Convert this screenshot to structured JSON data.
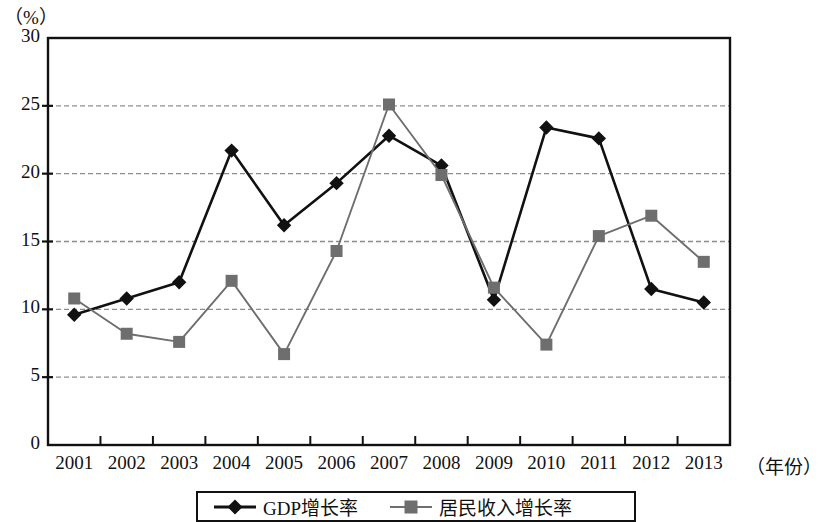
{
  "chart_data": {
    "type": "line",
    "title": "",
    "subtitle": "",
    "unit_label": "（%）",
    "xlabel": "（年份）",
    "ylabel": "",
    "ylim": [
      0,
      30
    ],
    "ytick_labels": [
      "0",
      "5",
      "10",
      "15",
      "20",
      "25",
      "30"
    ],
    "ytick_values": [
      0,
      5,
      10,
      15,
      20,
      25,
      30
    ],
    "grid": "horizontal-dashed",
    "legend_position": "bottom-center",
    "categories": [
      "2001",
      "2002",
      "2003",
      "2004",
      "2005",
      "2006",
      "2007",
      "2008",
      "2009",
      "2010",
      "2011",
      "2012",
      "2013"
    ],
    "series": [
      {
        "name": "GDP增长率",
        "marker": "diamond",
        "color": "#111111",
        "values": [
          9.6,
          10.8,
          12.0,
          21.7,
          16.2,
          19.3,
          22.8,
          20.6,
          10.7,
          23.4,
          22.6,
          11.5,
          10.5
        ]
      },
      {
        "name": "居民收入增长率",
        "marker": "square",
        "color": "#6e6e6e",
        "values": [
          10.8,
          8.2,
          7.6,
          12.1,
          6.7,
          14.3,
          25.1,
          19.9,
          11.6,
          7.4,
          15.4,
          16.9,
          13.5
        ]
      }
    ]
  },
  "legend": {
    "items": [
      {
        "label": "GDP增长率",
        "marker": "diamond",
        "color": "#111111"
      },
      {
        "label": "居民收入增长率",
        "marker": "square",
        "color": "#6e6e6e"
      }
    ]
  }
}
